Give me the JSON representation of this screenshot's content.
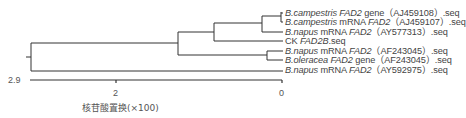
{
  "diagram": {
    "type": "phylogenetic-tree",
    "leaves": [
      {
        "species": "B.campestris",
        "mid": " ",
        "gene": "FAD2",
        "suffix": " gene（AJ459108）.seq",
        "y": 13
      },
      {
        "species": "B.campestris",
        "mid": " mRNA ",
        "gene": "FAD2",
        "suffix": "（AJ459107）.seq",
        "y": 22
      },
      {
        "species": "B.napus",
        "mid": " mRNA ",
        "gene": "FAD2",
        "suffix": "（AY577313）.seq",
        "y": 32
      },
      {
        "species": "",
        "mid": "CK ",
        "gene": "FAD2B",
        "suffix": ".seq",
        "y": 41
      },
      {
        "species": "B.napus",
        "mid": " mRNA ",
        "gene": "FAD2",
        "suffix": "（AF243045）.seq",
        "y": 51
      },
      {
        "species": "B.oleracea",
        "mid": " ",
        "gene": "FAD2",
        "suffix": " gene（AF243045）.seq",
        "y": 60
      },
      {
        "species": "B.napus",
        "mid": " mRNA ",
        "gene": "FAD2",
        "suffix": "（AY592975）.seq",
        "y": 70
      }
    ],
    "scale": {
      "left_label": "2.9",
      "tick_label": "2",
      "right_label": "0",
      "title": "核苷酸置换(×100)"
    }
  }
}
